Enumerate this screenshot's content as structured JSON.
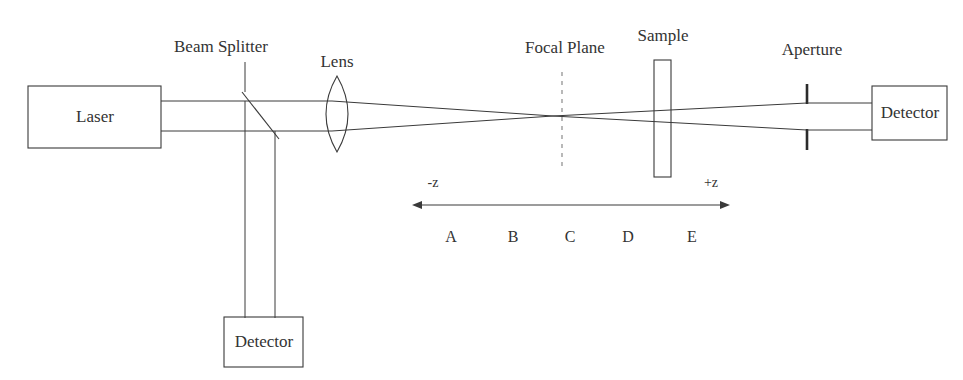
{
  "diagram": {
    "background_color": "#ffffff",
    "line_color": "#3a3a3a",
    "text_color": "#333333",
    "components": {
      "laser": {
        "label": "Laser",
        "shape": "rectangle"
      },
      "beam_splitter": {
        "label": "Beam Splitter",
        "shape": "diagonal-line"
      },
      "lens": {
        "label": "Lens",
        "shape": "biconvex-lens"
      },
      "focal_plane": {
        "label": "Focal Plane",
        "shape": "dashed-vertical-line"
      },
      "sample": {
        "label": "Sample",
        "shape": "thin-vertical-rectangle"
      },
      "aperture": {
        "label": "Aperture",
        "shape": "two-vertical-bars"
      },
      "detector_transmission": {
        "label": "Detector",
        "shape": "rectangle"
      },
      "detector_reference": {
        "label": "Detector",
        "shape": "rectangle"
      }
    },
    "z_axis": {
      "negative_label": "-z",
      "positive_label": "+z",
      "arrow_style": "double-headed",
      "positions": [
        {
          "id": "A",
          "label": "A"
        },
        {
          "id": "B",
          "label": "B"
        },
        {
          "id": "C",
          "label": "C"
        },
        {
          "id": "D",
          "label": "D"
        },
        {
          "id": "E",
          "label": "E"
        }
      ]
    }
  }
}
